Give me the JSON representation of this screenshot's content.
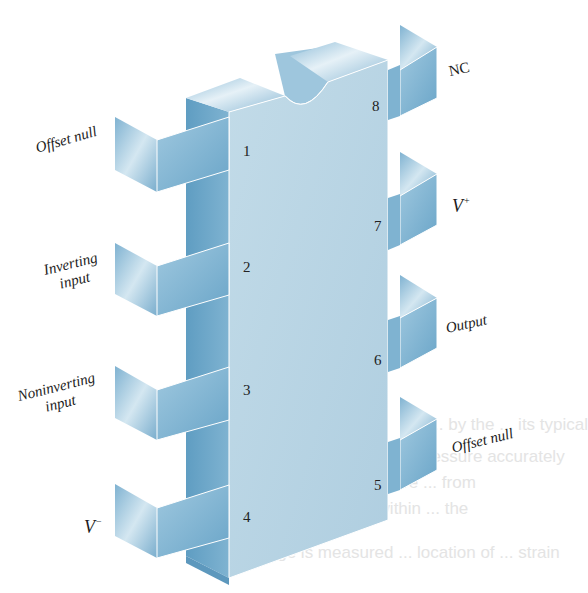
{
  "figure": {
    "colors": {
      "front_face": "#b8d4e3",
      "side_face": "#6fa7c8",
      "top_face": "#a9cbdf",
      "pin_front": "#8fbfdb",
      "pin_back": "#9cc4dc",
      "text": "#1c1c1c"
    }
  },
  "pins": [
    {
      "number": "1",
      "label": "Offset null",
      "side": "left"
    },
    {
      "number": "2",
      "label_line1": "Inverting",
      "label_line2": "input",
      "side": "left"
    },
    {
      "number": "3",
      "label_line1": "Noninverting",
      "label_line2": "input",
      "side": "left"
    },
    {
      "number": "4",
      "label": "V",
      "sup": "−",
      "side": "left"
    },
    {
      "number": "5",
      "label": "Offset null",
      "side": "right"
    },
    {
      "number": "6",
      "label": "Output",
      "side": "right"
    },
    {
      "number": "7",
      "label": "V",
      "sup": "+",
      "side": "right"
    },
    {
      "number": "8",
      "label": "NC",
      "side": "right"
    }
  ],
  "bleed_through_text": [
    "are ... by the ... its typical",
    "than ... manometer ... pressure accurately",
    "variety of ... pages are ... from",
    "... bridge, and ... within ... the",
    "... bridge is measured ... location of ... strain"
  ]
}
